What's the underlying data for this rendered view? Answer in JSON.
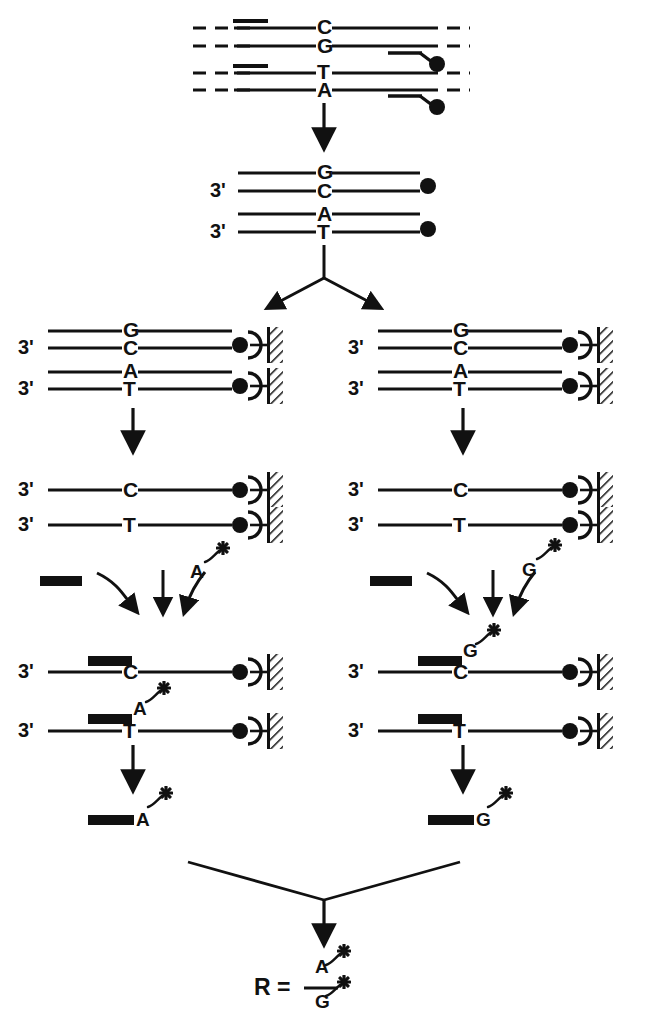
{
  "figure": {
    "type": "process-flow-diagram",
    "colors": {
      "ink": "#111111",
      "background": "#ffffff"
    },
    "glyphs": {
      "biotin": "filled-circle",
      "streptavidin": "open-crescent",
      "solid_support": "hatched-wall",
      "primer": "thick-black-bar",
      "label_tag": "asterisk-star",
      "dashed_strand": "dashed-line",
      "prime_mark": "'"
    }
  },
  "panels": {
    "p1": {
      "name": "genomic-dna-with-biotinylated-primers",
      "duplex_top": {
        "upper_base": "C",
        "lower_base": "G"
      },
      "duplex_bottom": {
        "upper_base": "T",
        "lower_base": "A"
      },
      "biotin_count": 2
    },
    "p2": {
      "name": "pcr-amplified-biotinylated-products",
      "strands": [
        {
          "five_label": "",
          "upper_base": "G",
          "lower_base": "C",
          "three_label": "3'",
          "biotin": true
        },
        {
          "five_label": "",
          "upper_base": "A",
          "lower_base": "T",
          "three_label": "3'",
          "biotin": true
        }
      ]
    },
    "p3": {
      "name": "capture-on-streptavidin-support",
      "strands": [
        {
          "three_label": "3'",
          "upper_base": "G",
          "lower_base": "C",
          "biotin": true,
          "support": true
        },
        {
          "three_label": "3'",
          "upper_base": "A",
          "lower_base": "T",
          "biotin": true,
          "support": true
        }
      ]
    },
    "p4": {
      "name": "denatured-single-strands",
      "strands": [
        {
          "three_label": "3'",
          "base": "C",
          "biotin": true,
          "support": true
        },
        {
          "three_label": "3'",
          "base": "T",
          "biotin": true,
          "support": true
        }
      ]
    },
    "p5": {
      "name": "primer-and-labeled-nucleotide-addition",
      "left_reaction_nucleotide": "A",
      "right_reaction_nucleotide": "G",
      "label_tag": "*",
      "arrows": 3
    },
    "p6": {
      "name": "primer-extension-products",
      "left": [
        {
          "three_label": "3'",
          "base": "C",
          "primer": true,
          "incorporated": "",
          "tag": "",
          "biotin": true,
          "support": true
        },
        {
          "three_label": "3'",
          "base": "T",
          "primer": true,
          "incorporated": "A",
          "tag": "*",
          "biotin": true,
          "support": true
        }
      ],
      "right": [
        {
          "three_label": "3'",
          "base": "C",
          "primer": true,
          "incorporated": "G",
          "tag": "*",
          "biotin": true,
          "support": true
        },
        {
          "three_label": "3'",
          "base": "T",
          "primer": true,
          "incorporated": "",
          "tag": "",
          "biotin": true,
          "support": true
        }
      ]
    },
    "p7": {
      "name": "eluted-labeled-primers",
      "left": {
        "base": "A",
        "tag": "*"
      },
      "right": {
        "base": "G",
        "tag": "*"
      }
    },
    "p8": {
      "name": "result-ratio",
      "r_symbol": "R",
      "equals": "=",
      "numerator": "A",
      "numerator_tag": "*",
      "denominator": "G",
      "denominator_tag": "*"
    }
  }
}
